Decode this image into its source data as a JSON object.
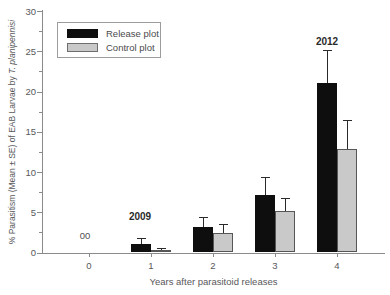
{
  "chart_data": {
    "type": "bar",
    "title": "",
    "xlabel": "Years after parasitoid releases",
    "ylabel_main": "% Parasitism (Mean ± SE) of EAB Larvae by ",
    "ylabel_italic": "T. planipennisi",
    "categories": [
      0,
      1,
      2,
      3,
      4
    ],
    "series": [
      {
        "name": "Release plot",
        "color": "#0e0e0e",
        "border": "#0e0e0e",
        "values": [
          0,
          1.1,
          3.2,
          7.2,
          21.1
        ],
        "se": [
          0,
          0.7,
          1.2,
          2.2,
          4.0
        ]
      },
      {
        "name": "Control plot",
        "color": "#c9c9c9",
        "border": "#565656",
        "values": [
          0,
          0.3,
          2.4,
          5.2,
          12.8
        ],
        "se": [
          0,
          0.2,
          1.1,
          1.6,
          3.7
        ]
      }
    ],
    "ylim": [
      0,
      30
    ],
    "y_major_ticks": [
      0,
      5,
      10,
      15,
      20,
      25,
      30
    ],
    "y_minor_ticks": [
      2.5,
      7.5,
      12.5,
      17.5,
      22.5,
      27.5
    ],
    "grid": false,
    "legend_position": "top-left",
    "annotations": [
      {
        "text": "00",
        "x_year": 0,
        "dx": -4,
        "y_value": 2.2,
        "bold": false
      },
      {
        "text": "2009",
        "x_year": 1,
        "dx": -11,
        "y_value": 4.5,
        "bold": true
      },
      {
        "text": "2012",
        "x_year": 4,
        "dx": -10,
        "y_value": 26.3,
        "bold": true
      }
    ]
  },
  "legend": {
    "items": [
      {
        "label": "Release plot",
        "color": "#0e0e0e",
        "border": "#0e0e0e"
      },
      {
        "label": "Control plot",
        "color": "#c9c9c9",
        "border": "#6e6e6e"
      }
    ]
  },
  "colors": {
    "axis": "#8a8a8a",
    "tick_text": "#58585a",
    "error_bar": "#2a2a2a",
    "annotation_bold": "#2a2a2a",
    "annotation_plain": "#4f4f4f"
  }
}
